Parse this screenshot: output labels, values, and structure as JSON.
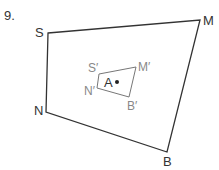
{
  "problem_number": "9.",
  "outer_quad": {
    "labels": {
      "S": "S",
      "M": "M",
      "B": "B",
      "N": "N"
    },
    "stroke": "#333333"
  },
  "inner_quad": {
    "labels": {
      "S": "S′",
      "M": "M′",
      "B": "B′",
      "N": "N′"
    },
    "stroke": "#666666"
  },
  "center": {
    "label": "A"
  }
}
